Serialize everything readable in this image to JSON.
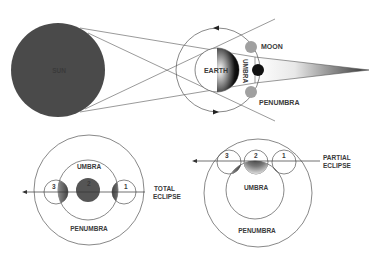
{
  "colors": {
    "sun": "#4a4a4a",
    "line": "#555555",
    "text": "#3a3a3a",
    "moon_dark": "#111111",
    "moon_penumbra": "#a0a0a0",
    "umbra_moon": "#555555"
  },
  "top_diagram": {
    "sun_label": "SUN",
    "earth_label": "EARTH",
    "umbra_label": "UMBRA",
    "moon_label": "MOON",
    "penumbra_label": "PENUMBRA"
  },
  "total_eclipse": {
    "caption_line1": "TOTAL",
    "caption_line2": "ECLIPSE",
    "umbra_label": "UMBRA",
    "penumbra_label": "PENUMBRA",
    "positions": [
      "1",
      "2",
      "3"
    ]
  },
  "partial_eclipse": {
    "caption_line1": "PARTIAL",
    "caption_line2": "ECLIPSE",
    "umbra_label": "UMBRA",
    "penumbra_label": "PENUMBRA",
    "positions": [
      "1",
      "2",
      "3"
    ]
  }
}
